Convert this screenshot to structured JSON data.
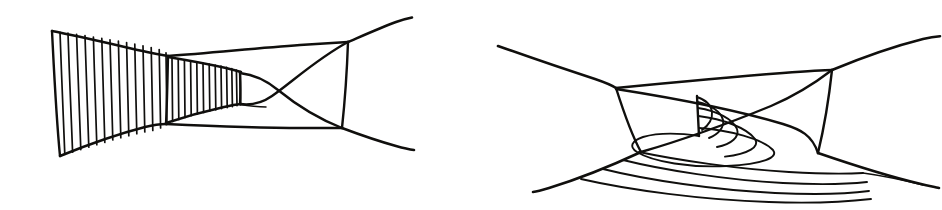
{
  "canvas": {
    "width": 942,
    "height": 210,
    "background_color": "#ffffff",
    "ink_color": "#100f0d",
    "media": "hand-drawn pen-and-ink line drawing",
    "figure_count": 2
  },
  "figures": [
    {
      "id": "left-figure",
      "name": "hatched-funnel-figure",
      "description": "Hand-drawn funnel/horn shaped region whose left portion is filled with closely spaced vertical hatch lines, opening at left and narrowing to the right, joined to a quadrilateral box with two crossing diagonal strands at the right.",
      "bbox": [
        40,
        14,
        410,
        168
      ],
      "hatch_bands": [
        {
          "name": "outer-hatch-band",
          "line_count": 14,
          "orientation": "near-vertical",
          "x_start": 58,
          "x_end": 168
        },
        {
          "name": "inner-hatch-band",
          "line_count": 13,
          "orientation": "near-vertical",
          "x_start": 170,
          "x_end": 238
        }
      ],
      "outline_points": {
        "top_left": [
          52,
          31
        ],
        "bottom_left": [
          60,
          156
        ],
        "waist_top": [
          168,
          56
        ],
        "waist_bottom": [
          166,
          124
        ],
        "neck_top": [
          240,
          72
        ],
        "neck_bottom": [
          238,
          104
        ],
        "box_top_right": [
          348,
          42
        ],
        "box_bottom_right": [
          342,
          128
        ],
        "tail_top_end": [
          410,
          18
        ],
        "tail_bottom_end": [
          412,
          150
        ]
      },
      "crossing_strands": 2
    },
    {
      "id": "right-figure",
      "name": "spiral-leaf-figure",
      "description": "Hand-drawn quadrilateral region with two crossing diagonals; a set of nested spiralling arcs winds out of a small vertical segment near the centre and sweeps across the lower half of the figure, with long curved strands leaving to the lower left and lower right.",
      "bbox": [
        495,
        36,
        440,
        180
      ],
      "outline_points": {
        "box_top_left": [
          616,
          88
        ],
        "box_bottom_left": [
          641,
          152
        ],
        "box_top_right": [
          832,
          70
        ],
        "box_bottom_right": [
          818,
          153
        ],
        "tail_upper_left_end": [
          498,
          46
        ],
        "tail_upper_right_end": [
          940,
          40
        ],
        "tail_lower_left_end": [
          535,
          192
        ],
        "tail_lower_right_end": [
          938,
          188
        ]
      },
      "spiral": {
        "name": "nested-spiral-arcs",
        "arc_count": 5,
        "center_segment": [
          697,
          96,
          699,
          136
        ],
        "description": "concentric arcs spiralling inward toward a short vertical tick at the centre"
      },
      "lower_arc_family": {
        "name": "lower-nested-arcs",
        "arc_count": 4,
        "description": "four roughly parallel nested curves sweeping across the bottom of the figure"
      },
      "crossing_strands": 2
    }
  ],
  "labels": {
    "figure_left_caption": "",
    "figure_right_caption": ""
  }
}
